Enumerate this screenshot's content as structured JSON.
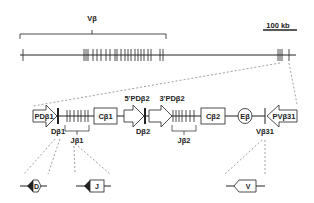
{
  "top": {
    "v_beta_label": "Vβ",
    "scale_bar_label": "100 kb"
  },
  "locus": {
    "pd_beta1": "PDβ1",
    "d_beta1": "Dβ1",
    "j_beta1": "Jβ1",
    "c_beta1": "Cβ1",
    "pd_beta2_5": "5'PDβ2",
    "d_beta2": "Dβ2",
    "pd_beta2_3": "3'PDβ2",
    "j_beta2": "Jβ2",
    "c_beta2": "Cβ2",
    "e_beta": "Eβ",
    "pv_beta31": "PVβ31",
    "v_beta31": "Vβ31"
  },
  "segments": {
    "d": "D",
    "j": "J",
    "v": "V"
  },
  "colors": {
    "line": "#222222",
    "dashed": "#777777"
  }
}
